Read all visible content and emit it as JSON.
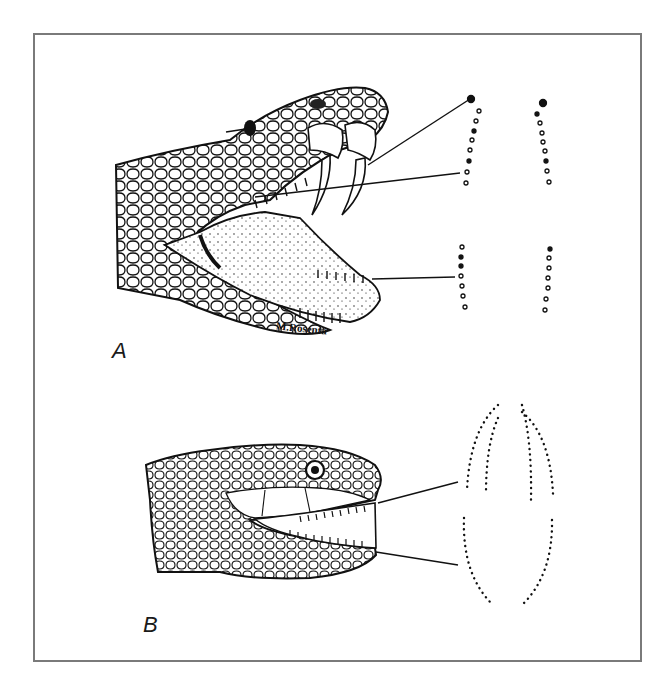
{
  "figure": {
    "panels": [
      {
        "label": "A",
        "subject": "viper head with open mouth and erect fangs",
        "signature": "M.Rosenta",
        "dentition_diagrams": [
          {
            "position": "upper-left",
            "dots": 9,
            "has_fang_marker": true
          },
          {
            "position": "upper-right",
            "dots": 9,
            "has_fang_marker": true
          },
          {
            "position": "lower-left",
            "dots": 7
          },
          {
            "position": "lower-right",
            "dots": 7
          }
        ]
      },
      {
        "label": "B",
        "subject": "non-venomous snake head with open mouth",
        "dentition_diagrams": [
          {
            "position": "upper",
            "rows": 4
          },
          {
            "position": "lower",
            "rows": 2
          }
        ]
      }
    ],
    "colors": {
      "ink": "#111111",
      "frame": "#7a7a7a",
      "background": "#ffffff"
    }
  }
}
